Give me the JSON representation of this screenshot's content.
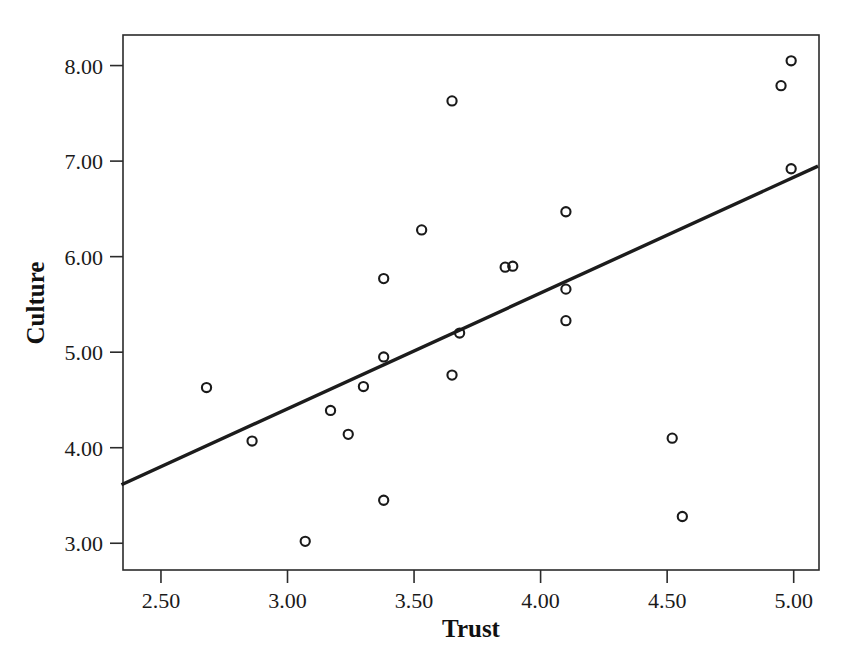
{
  "chart_data": {
    "type": "scatter",
    "title": "",
    "xlabel": "Trust",
    "ylabel": "Culture",
    "xlim": [
      2.35,
      5.1
    ],
    "ylim": [
      2.72,
      8.32
    ],
    "xticks": [
      "2.50",
      "3.00",
      "3.50",
      "4.00",
      "4.50",
      "5.00"
    ],
    "xtick_values": [
      2.5,
      3.0,
      3.5,
      4.0,
      4.5,
      5.0
    ],
    "yticks": [
      "3.00",
      "4.00",
      "5.00",
      "6.00",
      "7.00",
      "8.00"
    ],
    "ytick_values": [
      3.0,
      4.0,
      5.0,
      6.0,
      7.0,
      8.0
    ],
    "grid": false,
    "legend": "none",
    "marker": "open-circle",
    "marker_color": "#1a1a1a",
    "line_color": "#1c1c1c",
    "points": [
      {
        "x": 2.68,
        "y": 4.63
      },
      {
        "x": 2.86,
        "y": 4.07
      },
      {
        "x": 3.07,
        "y": 3.02
      },
      {
        "x": 3.17,
        "y": 4.39
      },
      {
        "x": 3.24,
        "y": 4.14
      },
      {
        "x": 3.3,
        "y": 4.64
      },
      {
        "x": 3.38,
        "y": 4.95
      },
      {
        "x": 3.38,
        "y": 5.77
      },
      {
        "x": 3.38,
        "y": 3.45
      },
      {
        "x": 3.53,
        "y": 6.28
      },
      {
        "x": 3.65,
        "y": 7.63
      },
      {
        "x": 3.65,
        "y": 4.76
      },
      {
        "x": 3.68,
        "y": 5.2
      },
      {
        "x": 3.86,
        "y": 5.89
      },
      {
        "x": 3.89,
        "y": 5.9
      },
      {
        "x": 4.1,
        "y": 6.47
      },
      {
        "x": 4.1,
        "y": 5.66
      },
      {
        "x": 4.1,
        "y": 5.33
      },
      {
        "x": 4.52,
        "y": 4.1
      },
      {
        "x": 4.56,
        "y": 3.28
      },
      {
        "x": 4.95,
        "y": 7.79
      },
      {
        "x": 4.99,
        "y": 8.05
      },
      {
        "x": 4.99,
        "y": 6.92
      }
    ],
    "fit_line": {
      "label": "linear-fit",
      "x_start": 2.35,
      "y_start": 3.62,
      "x_end": 5.09,
      "y_end": 6.94
    }
  },
  "axis": {
    "x_title": "Trust",
    "y_title": "Culture"
  }
}
